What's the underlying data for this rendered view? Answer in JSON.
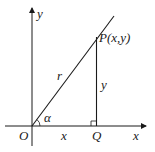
{
  "diagram": {
    "labels": {
      "y_axis": "y",
      "x_axis": "x",
      "origin": "O",
      "point_p": "P(x,y)",
      "point_q": "Q",
      "hypotenuse": "r",
      "vertical_leg": "y",
      "horizontal_leg": "x",
      "angle": "α"
    },
    "colors": {
      "stroke": "#1a1a1a",
      "background": "#ffffff"
    }
  }
}
